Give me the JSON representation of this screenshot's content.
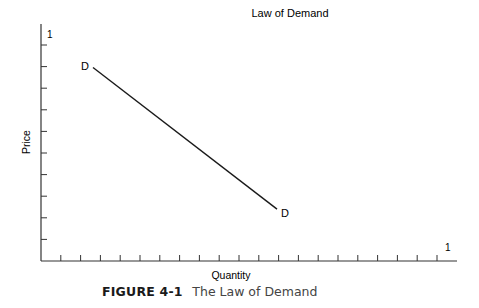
{
  "chart_data": {
    "type": "line",
    "title": "Law of Demand",
    "xlabel": "Quantity",
    "ylabel": "Price",
    "x_axis_end_label": "1",
    "y_axis_end_label": "1",
    "x_ticks": 20,
    "y_ticks": 10,
    "grid": false,
    "legend": null,
    "series": [
      {
        "name": "D",
        "start_label": "D",
        "end_label": "D",
        "points": [
          {
            "x": 0.13,
            "y": 0.82
          },
          {
            "x": 0.59,
            "y": 0.22
          }
        ]
      }
    ],
    "xlim": [
      0,
      1
    ],
    "ylim": [
      0,
      1
    ]
  },
  "caption": {
    "figure_number": "FIGURE 4-1",
    "title": "The Law of Demand"
  },
  "colors": {
    "axis": "#333333",
    "line": "#1a1a1a",
    "caption_title": "#444444"
  }
}
